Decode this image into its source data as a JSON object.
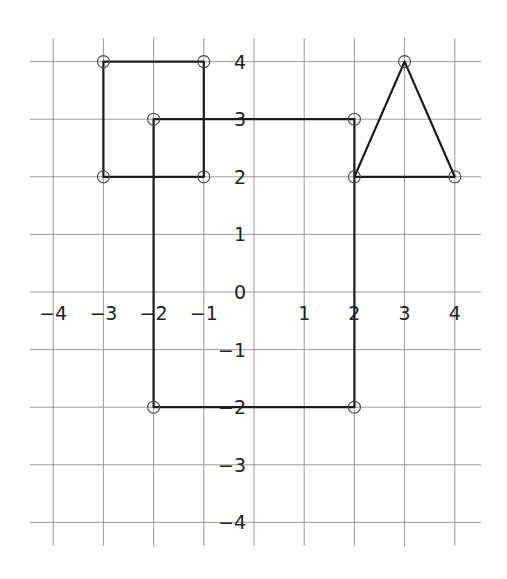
{
  "chart_data": {
    "type": "coordinate-grid",
    "title": "",
    "xlim": [
      -4,
      4
    ],
    "ylim": [
      -4,
      4
    ],
    "grid": true,
    "x_tick_labels": [
      "−4",
      "−3",
      "−2",
      "−1",
      "1",
      "2",
      "3",
      "4"
    ],
    "y_tick_labels": [
      "4",
      "3",
      "2",
      "1",
      "0",
      "−1",
      "−2",
      "−3",
      "−4"
    ],
    "origin_label": "0",
    "shapes": [
      {
        "name": "square",
        "vertices": [
          [
            -3,
            4
          ],
          [
            -1,
            4
          ],
          [
            -1,
            2
          ],
          [
            -3,
            2
          ]
        ]
      },
      {
        "name": "rectangle",
        "vertices": [
          [
            -2,
            3
          ],
          [
            2,
            3
          ],
          [
            2,
            -2
          ],
          [
            -2,
            -2
          ]
        ]
      },
      {
        "name": "triangle",
        "vertices": [
          [
            2,
            2
          ],
          [
            3,
            4
          ],
          [
            4,
            2
          ]
        ]
      }
    ],
    "colors": {
      "grid": "#9a9a9a",
      "shape": "#1a1a1a",
      "label": "#222222"
    }
  }
}
